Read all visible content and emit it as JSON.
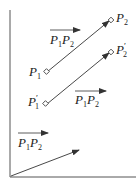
{
  "diagram": {
    "title": "",
    "labels": {
      "p1": "P",
      "p1_sub": "1",
      "p2": "P",
      "p2_sub": "2",
      "p1_prime": "P",
      "p1_prime_sub": "1",
      "p1_prime_mark": "′",
      "p2_prime": "P",
      "p2_prime_sub": "2",
      "p2_prime_mark": "′",
      "vec_top": {
        "a": "P",
        "a_sub": "1",
        "b": "P",
        "b_sub": "2"
      },
      "vec_middle": {
        "a": "P",
        "a_sub": "1",
        "b": "P",
        "b_sub": "2"
      },
      "vec_bottom": {
        "a": "P",
        "a_sub": "1",
        "b": "P",
        "b_sub": "2"
      }
    },
    "colors": {
      "line": "#333333",
      "text": "#222222"
    }
  }
}
